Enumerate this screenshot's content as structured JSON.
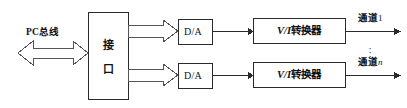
{
  "figure": {
    "background": "#ffffff",
    "line_color": "#2b2b2b",
    "text_color": "#111111",
    "width": 407,
    "height": 108
  },
  "bus": {
    "label": "PC总线",
    "arrow_style": "double-headed-hollow-block"
  },
  "interface": {
    "label": "接口",
    "char_top": "接",
    "char_bottom": "口"
  },
  "rows": [
    {
      "converter_da": "D/A",
      "converter_vi_prefix": "V/I",
      "converter_vi_suffix": "转换器",
      "converter_vi": "V/I转换器",
      "channel_label": "通道",
      "channel_index": "1",
      "channel_full": "通道1"
    },
    {
      "converter_da": "D/A",
      "converter_vi_prefix": "V/I",
      "converter_vi_suffix": "转换器",
      "converter_vi": "V/I转换器",
      "channel_label": "通道",
      "channel_index": "n",
      "channel_full": "通道n"
    }
  ],
  "ellipsis": {
    "glyph": "·",
    "meaning": "vertical-ellipsis-more-channels"
  }
}
